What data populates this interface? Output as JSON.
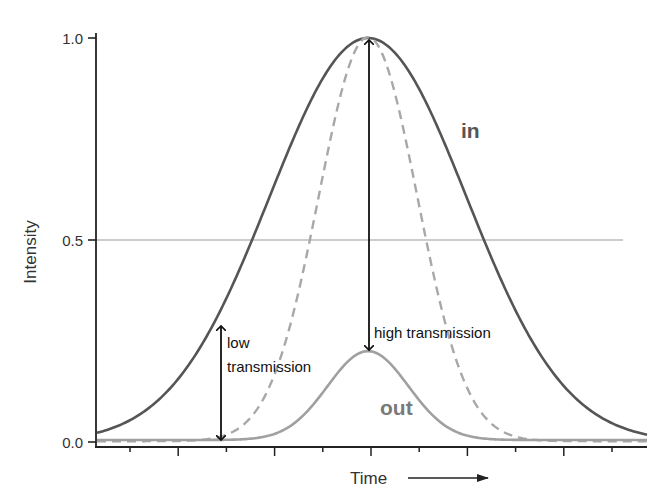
{
  "chart_data": {
    "type": "line",
    "title": "",
    "xlabel": "Time",
    "ylabel": "Intensity",
    "ylim": [
      0.0,
      1.0
    ],
    "y_ticks": [
      "0.0",
      "0.5",
      "1.0"
    ],
    "x_ticks_count": 11,
    "x_ticks_labeled": false,
    "grid": false,
    "reference_line": {
      "y": 0.5,
      "style": "thin grey horizontal"
    },
    "series": [
      {
        "name": "in",
        "shape": "gaussian",
        "center": 0.5,
        "peak": 1.0,
        "relative_width": 1.0,
        "style": "solid dark grey"
      },
      {
        "name": "in (transmitted portion, narrow)",
        "shape": "gaussian",
        "center": 0.5,
        "peak": 1.0,
        "relative_width": 0.5,
        "style": "dashed light grey"
      },
      {
        "name": "out",
        "shape": "gaussian",
        "center": 0.5,
        "peak": 0.22,
        "relative_width": 0.41,
        "style": "solid light grey"
      }
    ],
    "annotations": [
      {
        "text": "high transmission",
        "arrow": "double-headed vertical at peak, from 1.0 down to out peak 0.22"
      },
      {
        "text": "low transmission",
        "arrow": "double-headed vertical on leading edge, from ~0.28 down to 0.0"
      },
      {
        "text": "in",
        "position": "right of in curve, near 0.77"
      },
      {
        "text": "out",
        "position": "beneath out curve, near 0.08"
      }
    ]
  },
  "labels": {
    "y_tick_0": "0.0",
    "y_tick_05": "0.5",
    "y_tick_1": "1.0",
    "y_axis_title": "Intensity",
    "x_axis_title": "Time",
    "in_label": "in",
    "out_label": "out",
    "high_transmission": "high transmission",
    "low_transmission_line1": "low",
    "low_transmission_line2": "transmission"
  },
  "colors": {
    "in_curve": "#555555",
    "dashed_curve": "#a8a8a8",
    "out_curve": "#a0a0a0",
    "in_label": "#555555",
    "out_label": "#7a7a7a",
    "axis": "#222222",
    "reference_line": "#9a9a9a",
    "arrow": "#111111"
  }
}
